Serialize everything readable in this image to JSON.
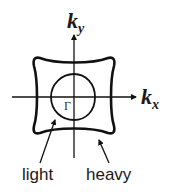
{
  "diagram": {
    "axes": {
      "x_label_main": "k",
      "x_label_sub": "x",
      "y_label_main": "k",
      "y_label_sub": "y"
    },
    "center_label": "Γ",
    "contours": [
      {
        "name": "light",
        "label": "light"
      },
      {
        "name": "heavy",
        "label": "heavy"
      }
    ],
    "colors": {
      "stroke": "#111111",
      "background": "#ffffff"
    }
  }
}
